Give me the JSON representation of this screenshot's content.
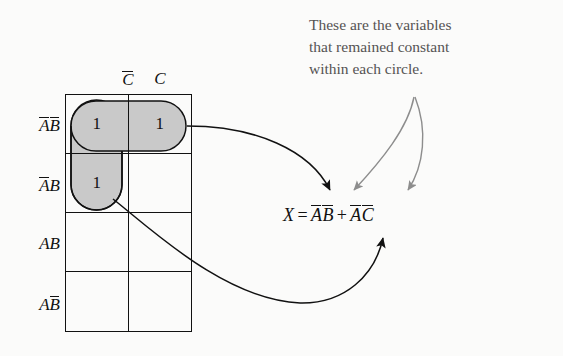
{
  "diagram": {
    "background_color": "#fbfbfa",
    "ink_color": "#111111",
    "group_fill_color": "#c9c9c9",
    "annotation_color": "#555353"
  },
  "kmap": {
    "column_headers": [
      {
        "id": "col-c-bar",
        "base": "C",
        "overbar": true
      },
      {
        "id": "col-c",
        "base": "C",
        "overbar": false
      }
    ],
    "row_headers": [
      {
        "id": "row-ab-bar-bar",
        "parts": [
          {
            "base": "A",
            "overbar": true
          },
          {
            "base": "B",
            "overbar": true
          }
        ]
      },
      {
        "id": "row-a-bar-b",
        "parts": [
          {
            "base": "A",
            "overbar": true
          },
          {
            "base": "B",
            "overbar": false
          }
        ]
      },
      {
        "id": "row-ab",
        "parts": [
          {
            "base": "A",
            "overbar": false
          },
          {
            "base": "B",
            "overbar": false
          }
        ]
      },
      {
        "id": "row-a-b-bar",
        "parts": [
          {
            "base": "A",
            "overbar": false
          },
          {
            "base": "B",
            "overbar": true
          }
        ]
      }
    ],
    "cells": [
      [
        "1",
        "1"
      ],
      [
        "1",
        ""
      ],
      [
        "",
        ""
      ],
      [
        "",
        ""
      ]
    ],
    "groups": [
      {
        "id": "group-horizontal-row1",
        "label": "horizontal circle row A-bar B-bar"
      },
      {
        "id": "group-vertical-col1",
        "label": "vertical circle column C-bar rows 1-2"
      }
    ]
  },
  "equation": {
    "output": "X",
    "equals": "=",
    "plus": "+",
    "terms": [
      {
        "id": "term-1",
        "parts": [
          {
            "base": "A",
            "overbar": true
          },
          {
            "base": "B",
            "overbar": true
          }
        ]
      },
      {
        "id": "term-2",
        "parts": [
          {
            "base": "A",
            "overbar": true
          },
          {
            "base": "C",
            "overbar": true
          }
        ]
      }
    ],
    "plain_text": "X = A̅B̅ + A̅C̅"
  },
  "annotation": {
    "lines": [
      "These are the variables",
      "that remained constant",
      "within each circle."
    ],
    "full_text": "These are the variables that remained constant within each circle."
  },
  "arrows": [
    {
      "id": "arrow-group1-to-term1",
      "color": "#111111",
      "from": "horizontal group",
      "to": "term A-bar B-bar"
    },
    {
      "id": "arrow-group2-to-term2",
      "color": "#111111",
      "from": "vertical group",
      "to": "term A-bar C-bar"
    },
    {
      "id": "arrow-annotation-to-bbar",
      "color": "#8d8d8d",
      "from": "annotation text",
      "to": "B overbar"
    },
    {
      "id": "arrow-annotation-to-cbar",
      "color": "#8d8d8d",
      "from": "annotation text",
      "to": "C overbar"
    }
  ]
}
